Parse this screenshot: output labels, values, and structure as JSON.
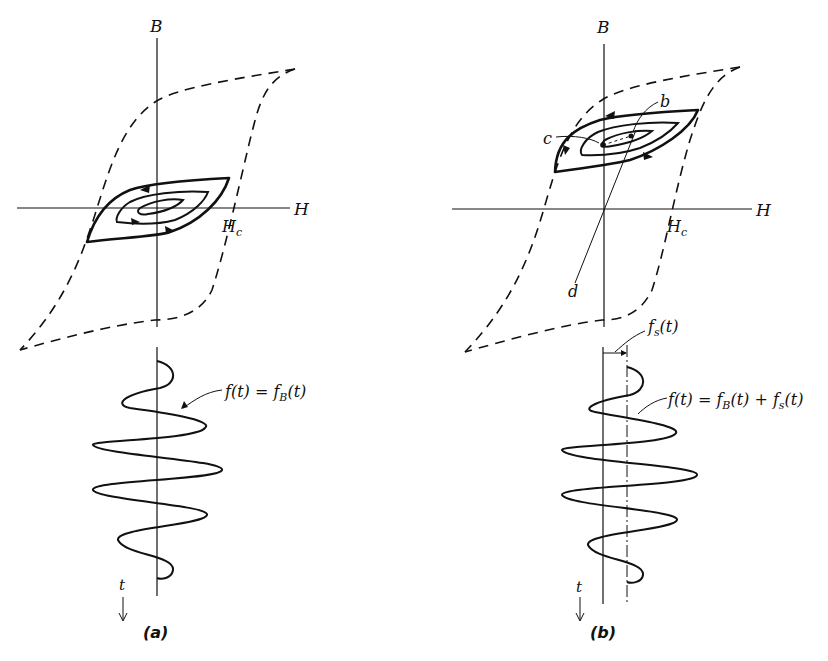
{
  "panels": [
    {
      "id": "a",
      "caption": "(a)",
      "axis_labels": {
        "vertical": "B",
        "horizontal": "H",
        "coercive": "H",
        "coercive_sub": "c"
      },
      "waveform_label": {
        "f": "f(t) = f",
        "sub": "B",
        "tail": "(t)"
      },
      "time_label": "t"
    },
    {
      "id": "b",
      "caption": "(b)",
      "axis_labels": {
        "vertical": "B",
        "horizontal": "H",
        "coercive": "H",
        "coercive_sub": "c"
      },
      "points": {
        "b": "b",
        "c": "c",
        "d": "d"
      },
      "offset_label": {
        "f": "f",
        "sub": "s",
        "tail": "(t)"
      },
      "waveform_label": {
        "f": "f(t) = f",
        "sub": "B",
        "mid": "(t) + f",
        "sub2": "s",
        "tail": "(t)"
      },
      "time_label": "t"
    }
  ]
}
